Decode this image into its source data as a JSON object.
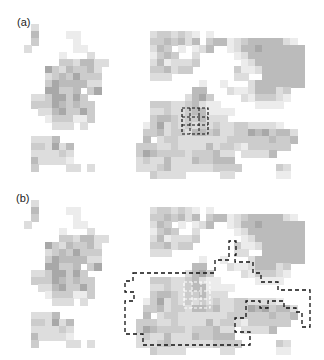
{
  "figure": {
    "panels": [
      {
        "label": "(a)",
        "overlay": "small-dashed-box"
      },
      {
        "label": "(b)",
        "overlay": "large-dashed-region-with-white-dashed-box"
      }
    ],
    "cell_size": 8,
    "grid_origin": [
      24,
      24
    ],
    "levels": {
      "0": "#ffffff",
      "1": "#ececec",
      "2": "#dddddd",
      "3": "#cccccc",
      "4": "#bbbbbb",
      "5": "#a8a8a8",
      "6": "#959595"
    },
    "rows": [
      "0200000000000000000000000000000000000000",
      "0400001100000000002332321010000000000000",
      "0300000100000000003343424034412344444210",
      "2000000110000000002430101240012445444444",
      "0000010002000000001343002000001244444444",
      "0000033244220000002412223000000124444444",
      "0005324334200000003342330000003112444444",
      "0002343533300000002220000000002200444444",
      "0003544442200000000000000100100024444444",
      "0005533403500000000000004400021124442300",
      "0223553530000000000000024530000213332100",
      "0333543433000000003332234211000001111000",
      "0022453353000000002232234411110000000000",
      "0001333113000000003443233422200000000000",
      "0000222020000000013523232323223322221000",
      "0000000000000000033423324434223354534420",
      "0222400000000000040233222222233333343340",
      "0332524000000000333223222242332133333300",
      "0222232000000000354333323334220222240000",
      "0422221000000000232242224334440000000000",
      "0300002202000000222342222223333000003200",
      "0000000000000000003222200000220000001100"
    ]
  }
}
